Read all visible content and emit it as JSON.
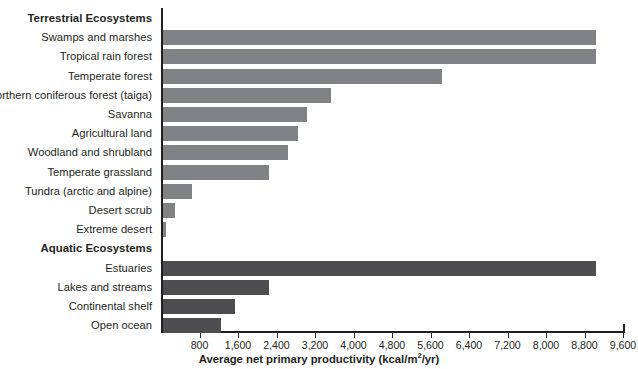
{
  "chart_data": {
    "type": "bar",
    "orientation": "horizontal",
    "title": "",
    "xlabel": "Average net primary productivity (kcal/m2/yr)",
    "ylabel": "",
    "xlim": [
      0,
      9600
    ],
    "xticks": [
      800,
      1600,
      2400,
      3200,
      4000,
      4800,
      5600,
      6400,
      7200,
      8000,
      8800,
      9600
    ],
    "xtick_labels": [
      "800",
      "1,600",
      "2,400",
      "3,200",
      "4,000",
      "4,800",
      "5,600",
      "6,400",
      "7,200",
      "8,000",
      "8,800",
      "9,600"
    ],
    "grid": false,
    "legend": null,
    "groups": [
      {
        "name": "Terrestrial Ecosystems",
        "color": "#808285",
        "categories": [
          "Swamps and marshes",
          "Tropical rain forest",
          "Temperate forest",
          "Northern coniferous forest (taiga)",
          "Savanna",
          "Agricultural land",
          "Woodland and shrubland",
          "Temperate grassland",
          "Tundra (arctic and alpine)",
          "Desert scrub",
          "Extreme desert"
        ],
        "values": [
          9000,
          9000,
          5800,
          3500,
          3000,
          2800,
          2600,
          2200,
          600,
          250,
          60
        ]
      },
      {
        "name": "Aquatic Ecosystems",
        "color": "#4d4d4f",
        "categories": [
          "Estuaries",
          "Lakes and streams",
          "Continental shelf",
          "Open ocean"
        ],
        "values": [
          9000,
          2200,
          1500,
          1200
        ]
      }
    ]
  },
  "rows": [
    {
      "kind": "heading",
      "label": "Terrestrial Ecosystems"
    },
    {
      "kind": "bar",
      "label": "Swamps and marshes",
      "value": 9000,
      "series": "terrestrial"
    },
    {
      "kind": "bar",
      "label": "Tropical rain forest",
      "value": 9000,
      "series": "terrestrial"
    },
    {
      "kind": "bar",
      "label": "Temperate forest",
      "value": 5800,
      "series": "terrestrial"
    },
    {
      "kind": "bar",
      "label": "Northern coniferous forest (taiga)",
      "value": 3500,
      "series": "terrestrial"
    },
    {
      "kind": "bar",
      "label": "Savanna",
      "value": 3000,
      "series": "terrestrial"
    },
    {
      "kind": "bar",
      "label": "Agricultural land",
      "value": 2800,
      "series": "terrestrial"
    },
    {
      "kind": "bar",
      "label": "Woodland and shrubland",
      "value": 2600,
      "series": "terrestrial"
    },
    {
      "kind": "bar",
      "label": "Temperate grassland",
      "value": 2200,
      "series": "terrestrial"
    },
    {
      "kind": "bar",
      "label": "Tundra (arctic and alpine)",
      "value": 600,
      "series": "terrestrial"
    },
    {
      "kind": "bar",
      "label": "Desert scrub",
      "value": 250,
      "series": "terrestrial"
    },
    {
      "kind": "bar",
      "label": "Extreme desert",
      "value": 60,
      "series": "terrestrial"
    },
    {
      "kind": "heading",
      "label": "Aquatic Ecosystems"
    },
    {
      "kind": "bar",
      "label": "Estuaries",
      "value": 9000,
      "series": "aquatic"
    },
    {
      "kind": "bar",
      "label": "Lakes and streams",
      "value": 2200,
      "series": "aquatic"
    },
    {
      "kind": "bar",
      "label": "Continental shelf",
      "value": 1500,
      "series": "aquatic"
    },
    {
      "kind": "bar",
      "label": "Open ocean",
      "value": 1200,
      "series": "aquatic"
    }
  ],
  "axis": {
    "title_prefix": "Average net primary productivity (kcal/m",
    "title_sup": "2",
    "title_suffix": "/yr)"
  }
}
